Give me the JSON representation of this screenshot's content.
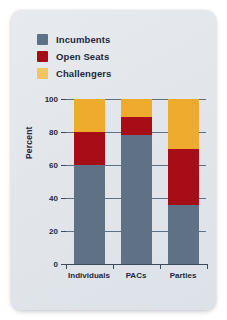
{
  "chart_data": {
    "type": "bar",
    "subtype": "stacked-bar-100",
    "title": "",
    "xlabel": "",
    "ylabel": "Percent",
    "ylim": [
      0,
      100
    ],
    "yticks": [
      0,
      20,
      40,
      60,
      80,
      100
    ],
    "ytick_labels": [
      "0",
      "20",
      "40",
      "60",
      "80",
      "100"
    ],
    "grid": true,
    "legend_position": "top-left",
    "categories": [
      "Individuals",
      "PACs",
      "Parties"
    ],
    "series": [
      {
        "name": "Incumbents",
        "color": "#5e7185",
        "values": [
          60,
          78,
          36
        ]
      },
      {
        "name": "Open Seats",
        "color": "#a70d17",
        "values": [
          20,
          11,
          34
        ]
      },
      {
        "name": "Challengers",
        "color": "#efab2e",
        "values": [
          20,
          11,
          30
        ]
      }
    ]
  },
  "legend": {
    "items": [
      {
        "label": "Incumbents",
        "color": "#5e7185"
      },
      {
        "label": "Open Seats",
        "color": "#a70d17"
      },
      {
        "label": "Challengers",
        "color": "#f3c55f"
      }
    ]
  },
  "axes": {
    "ylabel": "Percent",
    "ytick_labels": [
      "100",
      "80",
      "60",
      "40",
      "20",
      "0"
    ],
    "xtick_labels": [
      "Individuals",
      "PACs",
      "Parties"
    ]
  }
}
